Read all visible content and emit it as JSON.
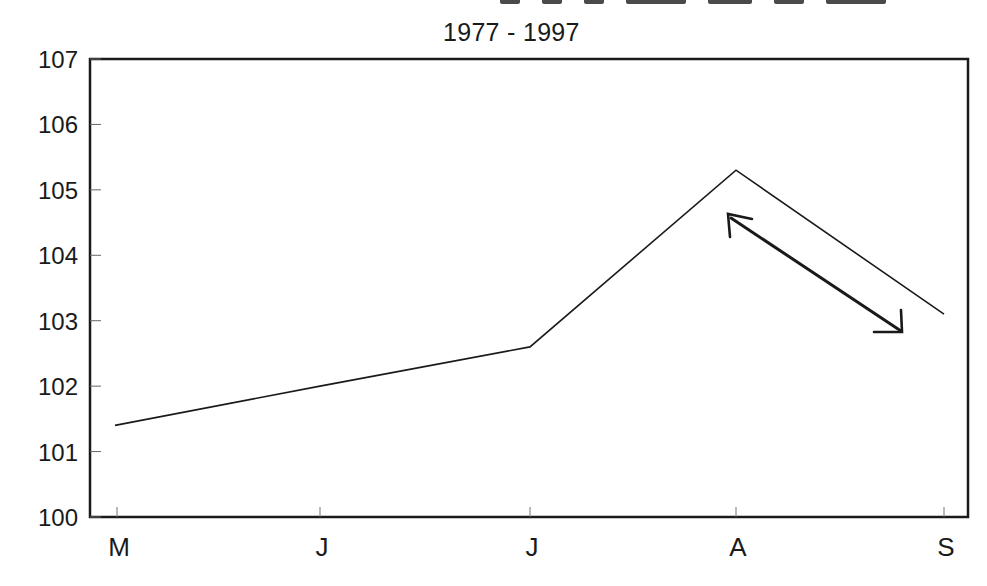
{
  "chart_data": {
    "type": "line",
    "title": "",
    "subtitle": "1977 - 1997",
    "xlabel": "",
    "ylabel": "",
    "categories": [
      "M",
      "J",
      "J",
      "A",
      "S"
    ],
    "series": [
      {
        "name": "series-1",
        "values": [
          101.4,
          102.0,
          102.6,
          105.3,
          103.1
        ]
      }
    ],
    "ylim": [
      100,
      107
    ],
    "yticks": [
      100,
      101,
      102,
      103,
      104,
      105,
      106,
      107
    ],
    "grid": false,
    "legend": "none",
    "annotations": [
      {
        "type": "double-arrow",
        "from_category": "A",
        "to_category": "S",
        "note": "hand-drawn double-headed arrow parallel to the A-S decline"
      }
    ]
  },
  "header": {
    "title_cut_off": true,
    "subtitle": "1977 - 1997"
  },
  "colors": {
    "line": "#1a1a1a",
    "axis": "#1a1a1a",
    "background": "#ffffff"
  }
}
